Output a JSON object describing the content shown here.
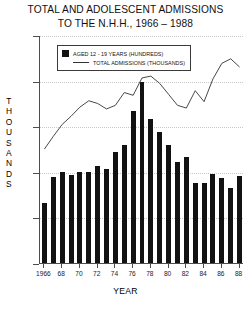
{
  "chart_data": {
    "type": "bar",
    "title": "TOTAL AND ADOLESCENT ADMISSIONS TO THE N.H.H., 1966 – 1988",
    "title_lines": [
      "TOTAL AND ADOLESCENT ADMISSIONS",
      "TO THE N.H.H., 1966 – 1988"
    ],
    "xlabel": "YEAR",
    "ylabel": "THOUSANDS",
    "ylabel_chars": [
      "T",
      "H",
      "O",
      "U",
      "S",
      "A",
      "N",
      "D",
      "S"
    ],
    "ylim": [
      0.0,
      2.5
    ],
    "yticks": [
      0.0,
      0.5,
      1.0,
      1.5,
      2.0,
      2.5
    ],
    "ytick_labels": [
      "0.0",
      "0.5",
      "1.0",
      "1.5",
      "2.0",
      "2.5"
    ],
    "grid": true,
    "legend_position": "upper-left",
    "categories": [
      "1966",
      "1967",
      "1968",
      "1969",
      "1970",
      "1971",
      "1972",
      "1973",
      "1974",
      "1975",
      "1976",
      "1977",
      "1978",
      "1979",
      "1980",
      "1981",
      "1982",
      "1983",
      "1984",
      "1985",
      "1986",
      "1987",
      "1988"
    ],
    "xtick_labels": [
      "1966",
      "68",
      "70",
      "72",
      "74",
      "76",
      "78",
      "80",
      "82",
      "84",
      "86",
      "88"
    ],
    "xtick_years": [
      1966,
      1968,
      1970,
      1972,
      1974,
      1976,
      1978,
      1980,
      1982,
      1984,
      1986,
      1988
    ],
    "series": [
      {
        "name": "AGED 12 - 19 YEARS (HUNDREDS)",
        "type": "bar",
        "color": "#121212",
        "unit": "hundreds",
        "values": [
          0.66,
          0.94,
          1.0,
          0.96,
          1.0,
          1.0,
          1.06,
          1.03,
          1.22,
          1.29,
          1.67,
          1.99,
          1.58,
          1.44,
          1.29,
          1.11,
          1.16,
          0.88,
          0.88,
          0.98,
          0.93,
          0.82,
          0.95
        ]
      },
      {
        "name": "TOTAL ADMISSIONS (THOUSANDS)",
        "type": "line",
        "color": "#333333",
        "unit": "thousands",
        "values": [
          1.26,
          1.4,
          1.53,
          1.62,
          1.72,
          1.79,
          1.76,
          1.7,
          1.74,
          1.88,
          1.85,
          2.04,
          2.06,
          1.98,
          1.86,
          1.74,
          1.71,
          1.9,
          1.78,
          2.03,
          2.2,
          2.25,
          2.16
        ]
      }
    ]
  },
  "legend": {
    "entries": [
      {
        "label": "AGED 12 - 19 YEARS (HUNDREDS)",
        "marker": "square"
      },
      {
        "label": "TOTAL ADMISSIONS (THOUSANDS)",
        "marker": "line"
      }
    ]
  }
}
